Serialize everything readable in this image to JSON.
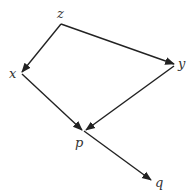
{
  "diagram": {
    "type": "directed-graph",
    "nodes": [
      {
        "id": "z",
        "label": "z"
      },
      {
        "id": "x",
        "label": "x"
      },
      {
        "id": "y",
        "label": "y"
      },
      {
        "id": "p",
        "label": "p"
      },
      {
        "id": "q",
        "label": "q"
      }
    ],
    "edges": [
      {
        "from": "z",
        "to": "x"
      },
      {
        "from": "z",
        "to": "y"
      },
      {
        "from": "x",
        "to": "p"
      },
      {
        "from": "y",
        "to": "p"
      },
      {
        "from": "p",
        "to": "q"
      }
    ],
    "colors": {
      "edge": "#222222",
      "label": "#333333",
      "background": "#ffffff"
    }
  }
}
